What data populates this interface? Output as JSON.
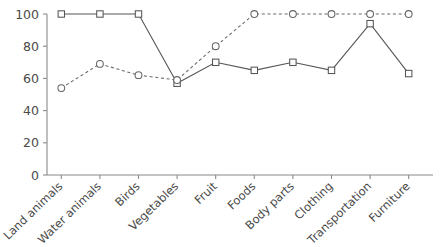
{
  "chart_data": {
    "type": "line",
    "title": "",
    "subtitle": "",
    "xlabel": "",
    "ylabel": "",
    "ylim": [
      0,
      100
    ],
    "yticks": [
      0,
      20,
      40,
      60,
      80,
      100
    ],
    "ytick_labels": [
      "0",
      "20",
      "40",
      "60",
      "80",
      "100"
    ],
    "grid": false,
    "legend": "none",
    "categories": [
      "Land animals",
      "Water animals",
      "Birds",
      "Vegetables",
      "Fruit",
      "Foods",
      "Body parts",
      "Clothing",
      "Transportation",
      "Furniture"
    ],
    "series": [
      {
        "name": "series-square-solid",
        "marker": "square",
        "linestyle": "solid",
        "color": "#555555",
        "values": [
          100,
          100,
          100,
          57,
          70,
          65,
          70,
          65,
          94,
          63
        ]
      },
      {
        "name": "series-circle-dashed",
        "marker": "circle",
        "linestyle": "dashed",
        "color": "#6b6b6b",
        "values": [
          54,
          69,
          62,
          59,
          80,
          100,
          100,
          100,
          100,
          100
        ]
      }
    ]
  },
  "axes": {
    "y_axis_name": "y-axis",
    "x_axis_name": "x-axis"
  }
}
